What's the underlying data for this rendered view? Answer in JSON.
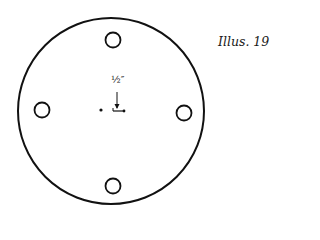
{
  "caption": "Illus. 19",
  "dimension_label": "½″",
  "colors": {
    "stroke": "#111111",
    "background": "#ffffff"
  },
  "diagram": {
    "outer_circle": {
      "cx": 111,
      "cy": 111,
      "r": 93
    },
    "holes": [
      {
        "position": "top",
        "cx": 113,
        "cy": 40,
        "r": 7.5
      },
      {
        "position": "left",
        "cx": 42,
        "cy": 110,
        "r": 7.5
      },
      {
        "position": "right",
        "cx": 184,
        "cy": 113,
        "r": 7.5
      },
      {
        "position": "bottom",
        "cx": 113,
        "cy": 186,
        "r": 7.5
      }
    ],
    "center_dot": {
      "cx": 101,
      "cy": 110
    },
    "measurement_mark": {
      "x1": 113,
      "x2": 124,
      "y": 111
    }
  }
}
